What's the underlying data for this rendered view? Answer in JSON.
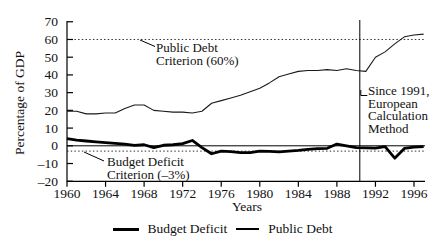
{
  "figure": {
    "ylabel": "Percentage of GDP",
    "xlabel": "Years",
    "annotations": {
      "debt_criterion_line1": "Public Debt",
      "debt_criterion_line2": "Criterion (60%)",
      "deficit_criterion_line1": "Budget Deficit",
      "deficit_criterion_line2": "Criterion (–3%)",
      "method_line1": "Since 1991,",
      "method_line2": "European",
      "method_line3": "Calculation",
      "method_line4": "Method"
    },
    "legend": {
      "deficit_label": "Budget Deficit",
      "debt_label": "Public Debt"
    }
  },
  "chart_data": {
    "type": "line",
    "title": "",
    "xlabel": "Years",
    "ylabel": "Percentage of GDP",
    "xlim": [
      1960,
      1997.2
    ],
    "ylim": [
      -20,
      70
    ],
    "x_ticks": [
      1960,
      1964,
      1968,
      1972,
      1976,
      1980,
      1984,
      1988,
      1992,
      1996
    ],
    "y_ticks": [
      70,
      60,
      50,
      40,
      30,
      20,
      10,
      0,
      -10,
      -20
    ],
    "grid": false,
    "legend_position": "bottom",
    "line_color": "#000000",
    "reference_lines": {
      "dotted_horizontal": [
        60,
        -3
      ],
      "solid_horizontal": [
        0
      ],
      "vertical_year": 1991
    },
    "x": [
      1960,
      1961,
      1962,
      1963,
      1964,
      1965,
      1966,
      1967,
      1968,
      1969,
      1970,
      1971,
      1972,
      1973,
      1974,
      1975,
      1976,
      1977,
      1978,
      1979,
      1980,
      1981,
      1982,
      1983,
      1984,
      1985,
      1986,
      1987,
      1988,
      1989,
      1990,
      1991,
      1992,
      1993,
      1994,
      1995,
      1996,
      1997
    ],
    "series": [
      {
        "name": "Budget Deficit",
        "style": "thick-black",
        "values": [
          4,
          3.2,
          2.7,
          2.2,
          1.8,
          1.4,
          1,
          0.2,
          0.6,
          -1,
          0.3,
          0.6,
          1.2,
          3,
          -1,
          -4.5,
          -3,
          -3.3,
          -3.8,
          -3.8,
          -3,
          -3.2,
          -3.4,
          -3,
          -2.6,
          -2,
          -1.6,
          -1.4,
          1,
          0,
          -1,
          -1.2,
          -1.3,
          -0.5,
          -7,
          -1.5,
          -0.8,
          -0.5
        ]
      },
      {
        "name": "Public Debt",
        "style": "thin-black",
        "values": [
          19.5,
          19.5,
          18,
          18,
          18.5,
          18.5,
          21,
          23,
          23,
          20,
          19.5,
          19,
          19,
          18.5,
          19.5,
          24,
          25.5,
          27,
          28.5,
          30.5,
          32.5,
          35.5,
          39,
          40.5,
          42,
          42.5,
          42.5,
          43,
          42.5,
          43.5,
          42.5,
          42,
          50,
          53,
          57.5,
          61.5,
          62.5,
          63
        ]
      }
    ]
  }
}
